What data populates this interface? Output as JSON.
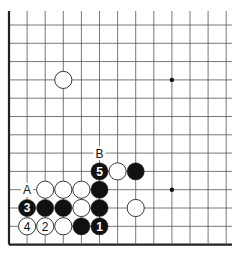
{
  "diagram": {
    "type": "go-board-fragment",
    "grid": {
      "cols": 13,
      "rows": 13,
      "origin_x": 9,
      "origin_y": 25,
      "step_x": 18.1,
      "step_y": 18.3,
      "top_y": 11,
      "right_x": 232,
      "edges": {
        "left": true,
        "bottom": true,
        "top": false,
        "right": false
      }
    },
    "star_points": [
      {
        "col": 9,
        "row": 3
      },
      {
        "col": 9,
        "row": 9
      }
    ],
    "stones": [
      {
        "color": "white",
        "col": 3,
        "row": 3,
        "label": ""
      },
      {
        "color": "black",
        "col": 5,
        "row": 8,
        "label": "5"
      },
      {
        "color": "white",
        "col": 6,
        "row": 8,
        "label": ""
      },
      {
        "color": "black",
        "col": 7,
        "row": 8,
        "label": ""
      },
      {
        "color": "white",
        "col": 2,
        "row": 9,
        "label": ""
      },
      {
        "color": "white",
        "col": 3,
        "row": 9,
        "label": ""
      },
      {
        "color": "white",
        "col": 4,
        "row": 9,
        "label": ""
      },
      {
        "color": "black",
        "col": 5,
        "row": 9,
        "label": ""
      },
      {
        "color": "black",
        "col": 1,
        "row": 10,
        "label": "3"
      },
      {
        "color": "black",
        "col": 2,
        "row": 10,
        "label": ""
      },
      {
        "color": "black",
        "col": 3,
        "row": 10,
        "label": ""
      },
      {
        "color": "white",
        "col": 4,
        "row": 10,
        "label": ""
      },
      {
        "color": "black",
        "col": 5,
        "row": 10,
        "label": ""
      },
      {
        "color": "white",
        "col": 7,
        "row": 10,
        "label": ""
      },
      {
        "color": "white",
        "col": 1,
        "row": 11,
        "label": "4"
      },
      {
        "color": "white",
        "col": 2,
        "row": 11,
        "label": "2"
      },
      {
        "color": "white",
        "col": 3,
        "row": 11,
        "label": ""
      },
      {
        "color": "black",
        "col": 4,
        "row": 11,
        "label": ""
      },
      {
        "color": "black",
        "col": 5,
        "row": 11,
        "label": "1"
      }
    ],
    "point_labels": [
      {
        "text": "A",
        "col": 1,
        "row": 9
      },
      {
        "text": "B",
        "col": 5,
        "row": 7
      }
    ],
    "colors": {
      "line": "#555555",
      "edge": "#222222",
      "black_stone": "#111111",
      "white_stone": "#ffffff",
      "stone_outline": "#222222"
    }
  }
}
